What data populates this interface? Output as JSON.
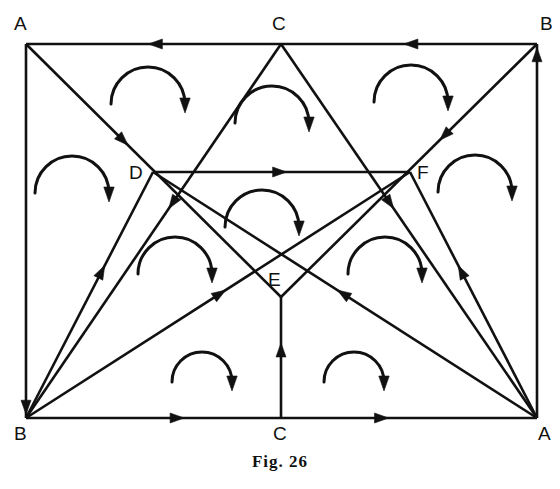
{
  "figure": {
    "caption": "Fig. 26",
    "stroke_color": "#111111",
    "background_color": "#ffffff",
    "width": 560,
    "height": 489
  },
  "vertices": [
    {
      "id": "A-top-left",
      "label": "A",
      "x": 26,
      "y": 44,
      "label_x": 14,
      "label_y": 14
    },
    {
      "id": "C-top-middle",
      "label": "C",
      "x": 281,
      "y": 44,
      "label_x": 272,
      "label_y": 14
    },
    {
      "id": "B-top-right",
      "label": "B",
      "x": 537,
      "y": 44,
      "label_x": 540,
      "label_y": 14
    },
    {
      "id": "D-left-inner",
      "label": "D",
      "x": 153,
      "y": 172,
      "label_x": 129,
      "label_y": 163
    },
    {
      "id": "F-right-inner",
      "label": "F",
      "x": 410,
      "y": 172,
      "label_x": 417,
      "label_y": 163
    },
    {
      "id": "E-center",
      "label": "E",
      "x": 281,
      "y": 297,
      "label_x": 268,
      "label_y": 270
    },
    {
      "id": "B-bottom-left",
      "label": "B",
      "x": 26,
      "y": 418,
      "label_x": 14,
      "label_y": 424
    },
    {
      "id": "C-bottom-middle",
      "label": "C",
      "x": 281,
      "y": 418,
      "label_x": 273,
      "label_y": 424
    },
    {
      "id": "A-bottom-right",
      "label": "A",
      "x": 537,
      "y": 418,
      "label_x": 538,
      "label_y": 424
    }
  ],
  "segments": [
    {
      "id": "top-left-edge",
      "x1": 281,
      "y1": 44,
      "x2": 26,
      "y2": 44,
      "arrow_t": 0.52
    },
    {
      "id": "top-right-edge",
      "x1": 537,
      "y1": 44,
      "x2": 281,
      "y2": 44,
      "arrow_t": 0.52
    },
    {
      "id": "left-edge",
      "x1": 26,
      "y1": 44,
      "x2": 26,
      "y2": 418,
      "arrow_t": 0.99
    },
    {
      "id": "right-edge",
      "x1": 537,
      "y1": 418,
      "x2": 537,
      "y2": 44,
      "arrow_t": 0.99
    },
    {
      "id": "bottom-left-edge",
      "x1": 26,
      "y1": 418,
      "x2": 281,
      "y2": 418,
      "arrow_t": 0.62
    },
    {
      "id": "bottom-right-edge",
      "x1": 281,
      "y1": 418,
      "x2": 537,
      "y2": 418,
      "arrow_t": 0.42
    },
    {
      "id": "diag-Atop-to-E",
      "x1": 26,
      "y1": 44,
      "x2": 281,
      "y2": 297,
      "arrow_t": 0.4
    },
    {
      "id": "diag-Btop-to-E",
      "x1": 537,
      "y1": 44,
      "x2": 281,
      "y2": 297,
      "arrow_t": 0.38
    },
    {
      "id": "diag-Ctop-to-Bbot",
      "x1": 281,
      "y1": 44,
      "x2": 26,
      "y2": 418,
      "arrow_t": 0.44
    },
    {
      "id": "diag-Ctop-to-Abot",
      "x1": 281,
      "y1": 44,
      "x2": 537,
      "y2": 418,
      "arrow_t": 0.44
    },
    {
      "id": "chord-D-to-F",
      "x1": 153,
      "y1": 172,
      "x2": 410,
      "y2": 172,
      "arrow_t": 0.52
    },
    {
      "id": "ray-Bbot-to-Ctop",
      "x1": 26,
      "y1": 418,
      "x2": 153,
      "y2": 172,
      "arrow_t": 0.62
    },
    {
      "id": "ray-Abot-to-Ctop",
      "x1": 537,
      "y1": 418,
      "x2": 410,
      "y2": 172,
      "arrow_t": 0.62
    },
    {
      "id": "ray-Bbot-to-F",
      "x1": 26,
      "y1": 418,
      "x2": 410,
      "y2": 172,
      "arrow_t": 0.52
    },
    {
      "id": "ray-Abot-to-D",
      "x1": 537,
      "y1": 418,
      "x2": 153,
      "y2": 172,
      "arrow_t": 0.52
    },
    {
      "id": "ray-Cbot-to-E",
      "x1": 281,
      "y1": 418,
      "x2": 281,
      "y2": 297,
      "arrow_t": 0.62
    }
  ],
  "curved_arrows": [
    {
      "id": "arc-top-left-face",
      "cx": 148,
      "cy": 104,
      "r": 37,
      "direction": "clockwise"
    },
    {
      "id": "arc-top-center-face",
      "cx": 272,
      "cy": 123,
      "r": 37,
      "direction": "clockwise"
    },
    {
      "id": "arc-top-right-face",
      "cx": 411,
      "cy": 102,
      "r": 37,
      "direction": "clockwise"
    },
    {
      "id": "arc-left-upper-face",
      "cx": 72,
      "cy": 193,
      "r": 37,
      "direction": "clockwise"
    },
    {
      "id": "arc-right-upper-face",
      "cx": 475,
      "cy": 192,
      "r": 37,
      "direction": "clockwise"
    },
    {
      "id": "arc-center-above-E",
      "cx": 262,
      "cy": 227,
      "r": 37,
      "direction": "clockwise"
    },
    {
      "id": "arc-left-middle-face",
      "cx": 175,
      "cy": 274,
      "r": 37,
      "direction": "clockwise"
    },
    {
      "id": "arc-right-middle-face",
      "cx": 385,
      "cy": 274,
      "r": 37,
      "direction": "clockwise"
    },
    {
      "id": "arc-bottom-left-face",
      "cx": 202,
      "cy": 382,
      "r": 30,
      "direction": "clockwise"
    },
    {
      "id": "arc-bottom-right-face",
      "cx": 354,
      "cy": 382,
      "r": 30,
      "direction": "clockwise"
    }
  ]
}
